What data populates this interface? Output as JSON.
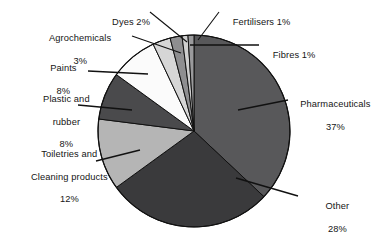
{
  "chart_data": {
    "type": "pie",
    "title": "",
    "subtitle": "",
    "xlabel": "",
    "ylabel": "",
    "grid": false,
    "legend_position": "callout-labels",
    "units": "percent",
    "total": 100,
    "start_angle_deg": 0,
    "direction": "clockwise",
    "categories": [
      "Pharmaceuticals",
      "Other",
      "Toiletries and Cleaning products",
      "Plastic and rubber",
      "Paints",
      "Agrochemicals",
      "Dyes",
      "Fertilisers",
      "Fibres"
    ],
    "values": [
      37,
      28,
      12,
      8,
      8,
      3,
      2,
      1,
      1
    ],
    "slices": [
      {
        "name": "Pharmaceuticals",
        "value": 37,
        "value_label": "37%",
        "color": "#58585a"
      },
      {
        "name": "Other",
        "value": 28,
        "value_label": "28%",
        "color": "#3a3a3c"
      },
      {
        "name": "Toiletries and Cleaning products",
        "value": 12,
        "value_label": "12%",
        "color": "#b5b5b5"
      },
      {
        "name": "Plastic and rubber",
        "value": 8,
        "value_label": "8%",
        "color": "#4a4a4c"
      },
      {
        "name": "Paints",
        "value": 8,
        "value_label": "8%",
        "color": "#fbfbfb"
      },
      {
        "name": "Agrochemicals",
        "value": 3,
        "value_label": "3%",
        "color": "#d6d6d6"
      },
      {
        "name": "Dyes",
        "value": 2,
        "value_label": "2%",
        "color": "#8e8e90"
      },
      {
        "name": "Fertilisers",
        "value": 1,
        "value_label": "1%",
        "color": "#cfcfcf"
      },
      {
        "name": "Fibres",
        "value": 1,
        "value_label": "1%",
        "color": "#9a9a9c"
      }
    ]
  },
  "labels": {
    "dyes": "Dyes 2%",
    "agrochemicals_line1": "Agrochemicals",
    "agrochemicals_line2": "3%",
    "paints_line1": "Paints",
    "paints_line2": "8%",
    "plastic_line1": "Plastic and",
    "plastic_line2": "rubber",
    "plastic_line3": "8%",
    "toiletries_line1": "Toiletries and",
    "toiletries_line2": "Cleaning products",
    "toiletries_line3": "12%",
    "fertilisers": "Fertilisers 1%",
    "fibres": "Fibres 1%",
    "pharma_line1": "Pharmaceuticals",
    "pharma_line2": "37%",
    "other_line1": "Other",
    "other_line2": "28%"
  },
  "style": {
    "background": "#ffffff",
    "outline": "#111111",
    "leader_line": "#111111"
  }
}
